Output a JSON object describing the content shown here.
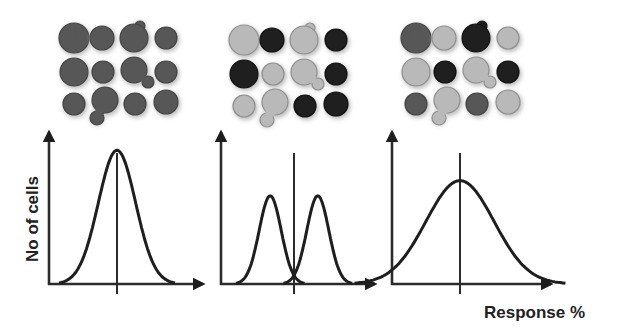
{
  "colors": {
    "dark": "#1f1f1f",
    "medium": "#575757",
    "light": "#b9b9b9",
    "light_edge": "#8f8f8f",
    "axis": "#2b2b2b"
  },
  "labels": {
    "y_axis": "No of cells",
    "x_axis": "Response %"
  },
  "panels": [
    {
      "name": "homogeneous",
      "description": "All cells respond similarly",
      "cells": [
        [
          "medium",
          "medium",
          "medium",
          "medium"
        ],
        [
          "medium",
          "medium",
          "medium",
          "medium"
        ],
        [
          "medium",
          "medium",
          "medium",
          "medium"
        ]
      ],
      "curves": [
        {
          "mean": 0.0,
          "sd": 0.11,
          "peak": 0.88
        }
      ]
    },
    {
      "name": "bimodal",
      "description": "Two distinct sub-populations",
      "cells": [
        [
          "light",
          "dark",
          "light",
          "dark"
        ],
        [
          "dark",
          "light",
          "light",
          "dark"
        ],
        [
          "light",
          "light",
          "dark",
          "dark"
        ]
      ],
      "curves": [
        {
          "mean": -0.14,
          "sd": 0.065,
          "peak": 0.58
        },
        {
          "mean": 0.14,
          "sd": 0.065,
          "peak": 0.58
        }
      ]
    },
    {
      "name": "heterogeneous",
      "description": "Broad spread of responses",
      "cells": [
        [
          "medium",
          "light",
          "dark",
          "light"
        ],
        [
          "light",
          "dark",
          "light",
          "dark"
        ],
        [
          "medium",
          "light",
          "medium",
          "light"
        ]
      ],
      "curves": [
        {
          "mean": 0.0,
          "sd": 0.2,
          "peak": 0.68
        }
      ]
    }
  ]
}
